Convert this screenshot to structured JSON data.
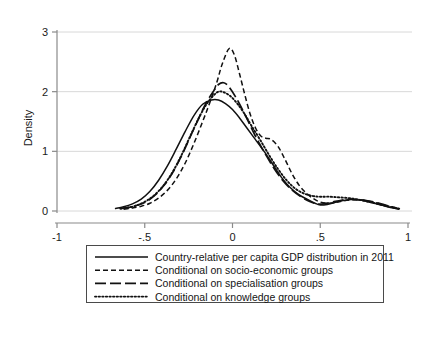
{
  "chart_data": {
    "type": "line",
    "title": "",
    "subtitle": "",
    "xlabel": "",
    "ylabel": "Density",
    "xlim": [
      -1,
      1
    ],
    "ylim": [
      0,
      3
    ],
    "xticks": [
      -1,
      -0.5,
      0,
      0.5,
      1
    ],
    "xticklabels": [
      "-1",
      "-.5",
      "0",
      ".5",
      "1"
    ],
    "yticks": [
      0,
      1,
      2,
      3
    ],
    "yticklabels": [
      "0",
      "1",
      "2",
      "3"
    ],
    "grid": "horizontal",
    "legend_position": "below-axes",
    "series": [
      {
        "name": "Country-relative per capita GDP distribution in 2011",
        "style": "solid",
        "x": [
          -0.67,
          -0.62,
          -0.57,
          -0.52,
          -0.47,
          -0.42,
          -0.37,
          -0.32,
          -0.27,
          -0.22,
          -0.17,
          -0.12,
          -0.08,
          -0.04,
          0.0,
          0.04,
          0.08,
          0.13,
          0.18,
          0.23,
          0.28,
          0.33,
          0.38,
          0.43,
          0.47,
          0.5,
          0.54,
          0.58,
          0.62,
          0.66,
          0.7,
          0.74,
          0.78,
          0.82,
          0.86,
          0.9,
          0.95
        ],
        "y": [
          0.04,
          0.07,
          0.12,
          0.2,
          0.33,
          0.52,
          0.76,
          1.04,
          1.33,
          1.6,
          1.79,
          1.86,
          1.86,
          1.8,
          1.7,
          1.56,
          1.4,
          1.2,
          1.0,
          0.78,
          0.56,
          0.39,
          0.27,
          0.19,
          0.13,
          0.1,
          0.11,
          0.14,
          0.17,
          0.19,
          0.19,
          0.18,
          0.15,
          0.12,
          0.09,
          0.06,
          0.03
        ]
      },
      {
        "name": "Conditional on socio-economic groups",
        "style": "dashed-short",
        "x": [
          -0.62,
          -0.57,
          -0.52,
          -0.47,
          -0.42,
          -0.37,
          -0.32,
          -0.27,
          -0.22,
          -0.17,
          -0.13,
          -0.09,
          -0.06,
          -0.02,
          0.01,
          0.04,
          0.07,
          0.1,
          0.13,
          0.16,
          0.19,
          0.22,
          0.26,
          0.3,
          0.34,
          0.38,
          0.42,
          0.46,
          0.5,
          0.55,
          0.6,
          0.65,
          0.7,
          0.75,
          0.8,
          0.85,
          0.9,
          0.95
        ],
        "y": [
          0.03,
          0.05,
          0.08,
          0.13,
          0.22,
          0.35,
          0.54,
          0.8,
          1.13,
          1.5,
          1.81,
          2.15,
          2.45,
          2.72,
          2.62,
          2.3,
          1.95,
          1.63,
          1.4,
          1.26,
          1.22,
          1.2,
          1.08,
          0.86,
          0.62,
          0.43,
          0.3,
          0.21,
          0.15,
          0.13,
          0.15,
          0.18,
          0.19,
          0.18,
          0.15,
          0.11,
          0.07,
          0.03
        ]
      },
      {
        "name": "Conditional on specialisation groups",
        "style": "dashed-long",
        "x": [
          -0.64,
          -0.59,
          -0.54,
          -0.49,
          -0.44,
          -0.39,
          -0.34,
          -0.29,
          -0.24,
          -0.19,
          -0.15,
          -0.11,
          -0.08,
          -0.05,
          -0.02,
          0.02,
          0.06,
          0.1,
          0.14,
          0.19,
          0.24,
          0.29,
          0.34,
          0.39,
          0.44,
          0.48,
          0.52,
          0.57,
          0.62,
          0.67,
          0.72,
          0.77,
          0.82,
          0.87,
          0.92,
          0.95
        ],
        "y": [
          0.04,
          0.06,
          0.1,
          0.16,
          0.27,
          0.43,
          0.65,
          0.93,
          1.25,
          1.57,
          1.81,
          2.0,
          2.12,
          2.15,
          2.08,
          1.9,
          1.68,
          1.44,
          1.2,
          0.94,
          0.7,
          0.5,
          0.35,
          0.24,
          0.16,
          0.12,
          0.12,
          0.15,
          0.18,
          0.2,
          0.19,
          0.17,
          0.14,
          0.1,
          0.06,
          0.03
        ]
      },
      {
        "name": "Conditional on knowledge groups",
        "style": "dotted",
        "x": [
          -0.64,
          -0.59,
          -0.54,
          -0.49,
          -0.44,
          -0.39,
          -0.34,
          -0.29,
          -0.24,
          -0.19,
          -0.15,
          -0.11,
          -0.08,
          -0.05,
          -0.01,
          0.03,
          0.07,
          0.11,
          0.16,
          0.21,
          0.26,
          0.31,
          0.36,
          0.41,
          0.46,
          0.5,
          0.55,
          0.6,
          0.65,
          0.7,
          0.75,
          0.8,
          0.85,
          0.9,
          0.95
        ],
        "y": [
          0.04,
          0.06,
          0.1,
          0.17,
          0.28,
          0.44,
          0.66,
          0.94,
          1.26,
          1.57,
          1.78,
          1.93,
          2.0,
          1.99,
          1.92,
          1.79,
          1.62,
          1.42,
          1.18,
          0.93,
          0.7,
          0.51,
          0.37,
          0.29,
          0.25,
          0.24,
          0.24,
          0.23,
          0.22,
          0.2,
          0.17,
          0.14,
          0.1,
          0.07,
          0.04
        ]
      }
    ]
  },
  "axes": {
    "ylabel": "Density",
    "xticklabels": [
      "-1",
      "-.5",
      "0",
      ".5",
      "1"
    ],
    "yticklabels": [
      "0",
      "1",
      "2",
      "3"
    ]
  },
  "legend": {
    "items": [
      {
        "label": "Country-relative per capita GDP distribution in 2011",
        "style": "solid"
      },
      {
        "label": "Conditional on socio-economic groups",
        "style": "dashed-short"
      },
      {
        "label": "Conditional on specialisation groups",
        "style": "dashed-long"
      },
      {
        "label": "Conditional on knowledge groups",
        "style": "dotted"
      }
    ]
  },
  "colors": {
    "curve": "#111111",
    "grid": "#d8d8d8",
    "axis": "#8a8a8a",
    "background": "#ffffff"
  }
}
